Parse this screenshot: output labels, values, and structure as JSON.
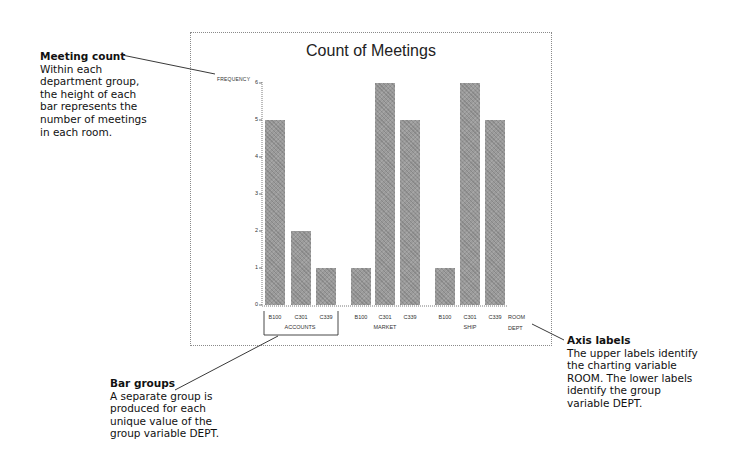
{
  "chart_data": {
    "type": "bar",
    "title": "Count of Meetings",
    "ylabel": "FREQUENCY",
    "xlabel_upper": "ROOM",
    "xlabel_lower": "DEPT",
    "ylim": [
      0,
      6
    ],
    "yticks": [
      "0",
      "1",
      "2",
      "3",
      "4",
      "5",
      "6"
    ],
    "grid": false,
    "legend": null,
    "groups": [
      {
        "name": "ACCOUNTS",
        "categories": [
          "B100",
          "C301",
          "C339"
        ],
        "values": [
          5,
          2,
          1
        ]
      },
      {
        "name": "MARKET",
        "categories": [
          "B100",
          "C301",
          "C339"
        ],
        "values": [
          1,
          6,
          5
        ]
      },
      {
        "name": "SHIP",
        "categories": [
          "B100",
          "C301",
          "C339"
        ],
        "values": [
          1,
          6,
          5
        ]
      }
    ],
    "categories": [
      "B100",
      "C301",
      "C339",
      "B100",
      "C301",
      "C339",
      "B100",
      "C301",
      "C339"
    ],
    "values": [
      5,
      2,
      1,
      1,
      6,
      5,
      1,
      6,
      5
    ]
  },
  "annotations": {
    "meeting_count": {
      "head": "Meeting count",
      "lines": [
        "Within each",
        "department group,",
        "the height of each",
        "bar represents the",
        "number of meetings",
        "in each room."
      ]
    },
    "bar_groups": {
      "head": "Bar groups",
      "lines": [
        "A separate group is",
        "produced for each",
        "unique value of the",
        "group variable DEPT."
      ]
    },
    "axis_labels": {
      "head": "Axis labels",
      "lines": [
        "The upper labels identify",
        "the charting variable",
        "ROOM. The lower labels",
        "identify the group",
        "variable DEPT."
      ]
    }
  },
  "colors": {
    "bar": "#9a9a9a",
    "text": "#111111",
    "frame": "#8a8a8a"
  }
}
